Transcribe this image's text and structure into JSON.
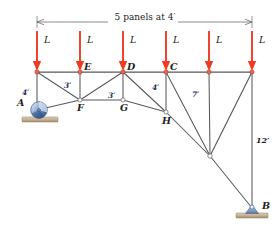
{
  "figure": {
    "name": "truss-diagram",
    "background": "#ffffff",
    "member_color": "#58595b",
    "load_color": "#ef3a24",
    "dimension_color": "#1b2a5e"
  },
  "span_dimension": {
    "label": "5 panels at 4′",
    "x_start": 37,
    "x_end": 252,
    "y": 22
  },
  "loads": [
    {
      "label": "L",
      "x": 37,
      "y_top": 31,
      "y_tip": 70
    },
    {
      "label": "L",
      "x": 80,
      "y_top": 31,
      "y_tip": 70
    },
    {
      "label": "L",
      "x": 123,
      "y_top": 31,
      "y_tip": 70
    },
    {
      "label": "L",
      "x": 166,
      "y_top": 31,
      "y_tip": 70
    },
    {
      "label": "L",
      "x": 209,
      "y_top": 31,
      "y_tip": 70
    },
    {
      "label": "L",
      "x": 252,
      "y_top": 31,
      "y_tip": 70
    }
  ],
  "joints": [
    {
      "name": "top-left",
      "label": "",
      "x": 37,
      "y": 72
    },
    {
      "name": "E",
      "label": "E",
      "x": 80,
      "y": 72
    },
    {
      "name": "D",
      "label": "D",
      "x": 123,
      "y": 72
    },
    {
      "name": "C",
      "label": "C",
      "x": 166,
      "y": 72
    },
    {
      "name": "top-five",
      "label": "",
      "x": 209,
      "y": 72
    },
    {
      "name": "top-right",
      "label": "",
      "x": 252,
      "y": 72
    },
    {
      "name": "A",
      "label": "A",
      "x": 37,
      "y": 110
    },
    {
      "name": "F",
      "label": "F",
      "x": 80,
      "y": 100
    },
    {
      "name": "G",
      "label": "G",
      "x": 123,
      "y": 100
    },
    {
      "name": "H",
      "label": "H",
      "x": 166,
      "y": 112
    },
    {
      "name": "apex",
      "label": "",
      "x": 210,
      "y": 156
    },
    {
      "name": "B",
      "label": "B",
      "x": 252,
      "y": 208
    }
  ],
  "member_dimensions": [
    {
      "label": "4′",
      "x": 26,
      "y": 92,
      "member": "A-to-top-left"
    },
    {
      "label": "3′",
      "x": 68,
      "y": 85,
      "member": "E-to-F"
    },
    {
      "label": "3′",
      "x": 112,
      "y": 95,
      "member": "D-to-G"
    },
    {
      "label": "4′",
      "x": 156,
      "y": 87,
      "member": "C-to-H"
    },
    {
      "label": "7′",
      "x": 197,
      "y": 94,
      "member": "panel-five-vertical"
    },
    {
      "label": "12′",
      "x": 258,
      "y": 140,
      "member": "right-vertical-to-B"
    }
  ],
  "supports": [
    {
      "name": "roller-support-A",
      "type": "roller",
      "x": 37,
      "y": 110,
      "label": "A"
    },
    {
      "name": "pin-support-B",
      "type": "pin",
      "x": 252,
      "y": 208,
      "label": "B"
    }
  ]
}
